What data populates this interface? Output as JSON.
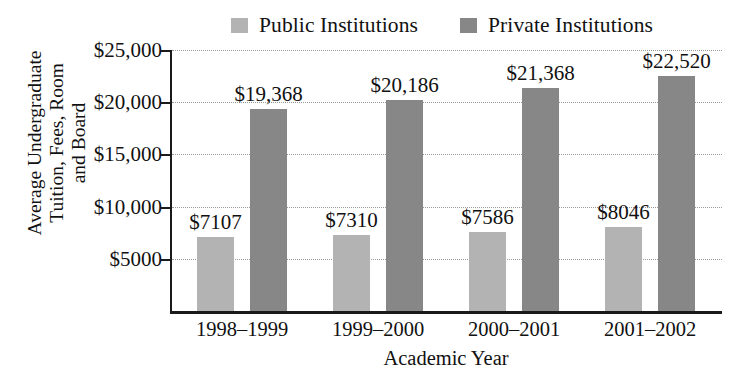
{
  "chart_data": {
    "type": "bar",
    "title": "",
    "xlabel": "Academic Year",
    "ylabel": "Average Undergraduate\nTuition, Fees, Room\nand Board",
    "categories": [
      "1998–1999",
      "1999–2000",
      "2000–2001",
      "2001–2002"
    ],
    "series": [
      {
        "name": "Public Institutions",
        "color": "#b3b3b3",
        "values": [
          7107,
          7310,
          7586,
          8046
        ],
        "value_labels": [
          "$7107",
          "$7310",
          "$7586",
          "$8046"
        ]
      },
      {
        "name": "Private Institutions",
        "color": "#878787",
        "values": [
          19368,
          20186,
          21368,
          22520
        ],
        "value_labels": [
          "$19,368",
          "$20,186",
          "$21,368",
          "$22,520"
        ]
      }
    ],
    "ylim": [
      0,
      25000
    ],
    "yticks": [
      25000,
      20000,
      15000,
      10000,
      5000
    ],
    "ytick_labels": [
      "$25,000",
      "$20,000",
      "$15,000",
      "$10,000",
      "$5000"
    ],
    "grid": true,
    "grid_style": "dotted-horizontal",
    "legend_position": "top-center"
  },
  "legend": {
    "entries": [
      {
        "label": "Public Institutions",
        "color": "#b3b3b3"
      },
      {
        "label": "Private Institutions",
        "color": "#878787"
      }
    ]
  },
  "axes": {
    "y_title": "Average Undergraduate\nTuition, Fees, Room\nand Board",
    "x_title": "Academic Year"
  }
}
